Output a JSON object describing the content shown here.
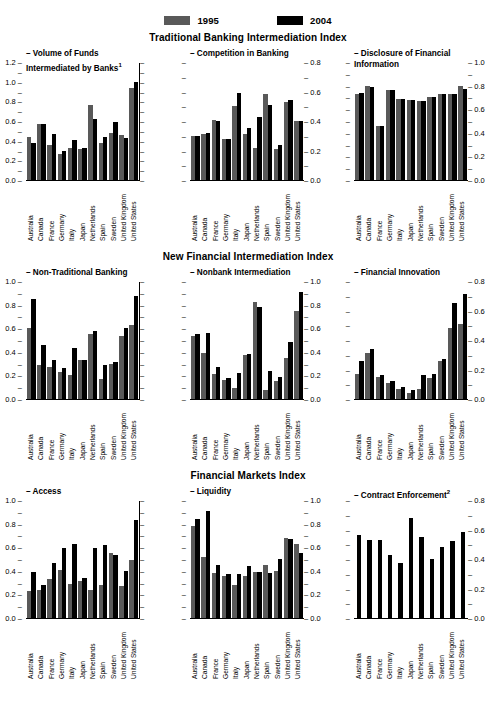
{
  "legend": {
    "items": [
      {
        "label": "1995",
        "color": "#595959",
        "key": "y1995"
      },
      {
        "label": "2004",
        "color": "#000000",
        "key": "y2004"
      }
    ]
  },
  "countries": [
    "Australia",
    "Canada",
    "France",
    "Germany",
    "Italy",
    "Japan",
    "Netherlands",
    "Spain",
    "Sweden",
    "United Kingdom",
    "United States"
  ],
  "sections": [
    {
      "title": "Traditional Banking Intermediation Index"
    },
    {
      "title": "New Financial Intermediation Index"
    },
    {
      "title": "Financial Markets Index"
    }
  ],
  "chart_data": [
    {
      "type": "bar",
      "title": "Volume of Funds\nIntermediated by Banks",
      "title_sup": "1",
      "section": "Traditional Banking Intermediation Index",
      "categories": [
        "Australia",
        "Canada",
        "France",
        "Germany",
        "Italy",
        "Japan",
        "Netherlands",
        "Spain",
        "Sweden",
        "United Kingdom",
        "United States"
      ],
      "series": [
        {
          "name": "1995",
          "values": [
            0.44,
            0.57,
            0.36,
            0.26,
            0.33,
            0.32,
            0.76,
            0.38,
            0.48,
            0.46,
            0.94
          ]
        },
        {
          "name": "2004",
          "values": [
            0.38,
            0.57,
            0.47,
            0.3,
            0.41,
            0.33,
            0.62,
            0.44,
            0.59,
            0.43,
            1.0
          ]
        }
      ],
      "axis_side": "left",
      "ylim": [
        0.0,
        1.2
      ],
      "yticks": [
        0.0,
        0.2,
        0.4,
        0.6,
        0.8,
        1.0,
        1.2
      ],
      "ylabel": "",
      "xlabel": "",
      "grid": false
    },
    {
      "type": "bar",
      "title": "Competition in Banking",
      "title_sup": "",
      "section": "Traditional Banking Intermediation Index",
      "categories": [
        "Australia",
        "Canada",
        "France",
        "Germany",
        "Italy",
        "Japan",
        "Netherlands",
        "Spain",
        "Sweden",
        "United Kingdom",
        "United States"
      ],
      "series": [
        {
          "name": "1995",
          "values": [
            0.3,
            0.31,
            0.41,
            0.28,
            0.5,
            0.31,
            0.22,
            0.58,
            0.21,
            0.53,
            0.4
          ]
        },
        {
          "name": "2004",
          "values": [
            0.3,
            0.32,
            0.4,
            0.28,
            0.59,
            0.35,
            0.43,
            0.51,
            0.24,
            0.54,
            0.4
          ]
        }
      ],
      "axis_side": "right",
      "ylim": [
        0.0,
        0.8
      ],
      "yticks": [
        0.0,
        0.2,
        0.4,
        0.6,
        0.8
      ],
      "ylabel": "",
      "xlabel": "",
      "grid": false
    },
    {
      "type": "bar",
      "title": "Disclosure of Financial\nInformation",
      "title_sup": "",
      "section": "Traditional Banking Intermediation Index",
      "categories": [
        "Australia",
        "Canada",
        "France",
        "Germany",
        "Italy",
        "Japan",
        "Netherlands",
        "Spain",
        "Sweden",
        "United Kingdom",
        "United States"
      ],
      "series": [
        {
          "name": "1995",
          "values": [
            0.73,
            0.8,
            0.46,
            0.76,
            0.69,
            0.68,
            0.67,
            0.7,
            0.73,
            0.73,
            0.8
          ]
        },
        {
          "name": "2004",
          "values": [
            0.74,
            0.79,
            0.46,
            0.76,
            0.69,
            0.68,
            0.67,
            0.7,
            0.73,
            0.73,
            0.77
          ]
        }
      ],
      "axis_side": "right",
      "ylim": [
        0.0,
        1.0
      ],
      "yticks": [
        0.0,
        0.2,
        0.4,
        0.6,
        0.8,
        1.0
      ],
      "ylabel": "",
      "xlabel": "",
      "grid": false
    },
    {
      "type": "bar",
      "title": "Non-Traditional Banking",
      "title_sup": "",
      "section": "New Financial Intermediation Index",
      "categories": [
        "Australia",
        "Canada",
        "France",
        "Germany",
        "Italy",
        "Japan",
        "Netherlands",
        "Spain",
        "Sweden",
        "United Kingdom",
        "United States"
      ],
      "series": [
        {
          "name": "1995",
          "values": [
            0.6,
            0.29,
            0.27,
            0.23,
            0.2,
            0.33,
            0.55,
            0.17,
            0.3,
            0.53,
            0.63
          ]
        },
        {
          "name": "2004",
          "values": [
            0.85,
            0.46,
            0.33,
            0.26,
            0.43,
            0.33,
            0.58,
            0.29,
            0.31,
            0.6,
            0.87
          ]
        }
      ],
      "axis_side": "left",
      "ylim": [
        0.0,
        1.0
      ],
      "yticks": [
        0.0,
        0.2,
        0.4,
        0.6,
        0.8,
        1.0
      ],
      "ylabel": "",
      "xlabel": "",
      "grid": false
    },
    {
      "type": "bar",
      "title": "Nonbank Intermediation",
      "title_sup": "",
      "section": "New Financial Intermediation Index",
      "categories": [
        "Australia",
        "Canada",
        "France",
        "Germany",
        "Italy",
        "Japan",
        "Netherlands",
        "Spain",
        "Sweden",
        "United Kingdom",
        "United States"
      ],
      "series": [
        {
          "name": "1995",
          "values": [
            0.53,
            0.39,
            0.21,
            0.16,
            0.09,
            0.37,
            0.82,
            0.08,
            0.15,
            0.35,
            0.75
          ]
        },
        {
          "name": "2004",
          "values": [
            0.55,
            0.56,
            0.27,
            0.18,
            0.22,
            0.38,
            0.78,
            0.24,
            0.19,
            0.48,
            0.91
          ]
        }
      ],
      "axis_side": "right",
      "ylim": [
        0.0,
        1.0
      ],
      "yticks": [
        0.0,
        0.2,
        0.4,
        0.6,
        0.8,
        1.0
      ],
      "ylabel": "",
      "xlabel": "",
      "grid": false
    },
    {
      "type": "bar",
      "title": "Financial Innovation",
      "title_sup": "",
      "section": "New Financial Intermediation Index",
      "categories": [
        "Australia",
        "Canada",
        "France",
        "Germany",
        "Italy",
        "Japan",
        "Netherlands",
        "Spain",
        "Sweden",
        "United Kingdom",
        "United States"
      ],
      "series": [
        {
          "name": "1995",
          "values": [
            0.17,
            0.31,
            0.15,
            0.11,
            0.07,
            0.04,
            0.07,
            0.14,
            0.26,
            0.48,
            0.51
          ]
        },
        {
          "name": "2004",
          "values": [
            0.26,
            0.34,
            0.16,
            0.12,
            0.08,
            0.06,
            0.16,
            0.17,
            0.27,
            0.65,
            0.71
          ]
        }
      ],
      "axis_side": "right",
      "ylim": [
        0.0,
        0.8
      ],
      "yticks": [
        0.0,
        0.2,
        0.4,
        0.6,
        0.8
      ],
      "ylabel": "",
      "xlabel": "",
      "grid": false
    },
    {
      "type": "bar",
      "title": "Access",
      "title_sup": "",
      "section": "Financial Markets Index",
      "categories": [
        "Australia",
        "Canada",
        "France",
        "Germany",
        "Italy",
        "Japan",
        "Netherlands",
        "Spain",
        "Sweden",
        "United Kingdom",
        "United States"
      ],
      "series": [
        {
          "name": "1995",
          "values": [
            0.23,
            0.24,
            0.33,
            0.41,
            0.29,
            0.31,
            0.24,
            0.28,
            0.55,
            0.27,
            0.49
          ]
        },
        {
          "name": "2004",
          "values": [
            0.39,
            0.28,
            0.47,
            0.59,
            0.63,
            0.34,
            0.59,
            0.62,
            0.53,
            0.4,
            0.83
          ]
        }
      ],
      "axis_side": "left",
      "ylim": [
        0.0,
        1.0
      ],
      "yticks": [
        0.0,
        0.2,
        0.4,
        0.6,
        0.8,
        1.0
      ],
      "ylabel": "",
      "xlabel": "",
      "grid": false
    },
    {
      "type": "bar",
      "title": "Liquidity",
      "title_sup": "",
      "section": "Financial Markets Index",
      "categories": [
        "Australia",
        "Canada",
        "France",
        "Germany",
        "Italy",
        "Japan",
        "Netherlands",
        "Spain",
        "Sweden",
        "United Kingdom",
        "United States"
      ],
      "series": [
        {
          "name": "1995",
          "values": [
            0.78,
            0.52,
            0.38,
            0.36,
            0.28,
            0.36,
            0.39,
            0.45,
            0.4,
            0.68,
            0.63
          ]
        },
        {
          "name": "2004",
          "values": [
            0.84,
            0.91,
            0.45,
            0.37,
            0.37,
            0.44,
            0.39,
            0.38,
            0.5,
            0.67,
            0.55
          ]
        }
      ],
      "axis_side": "right",
      "ylim": [
        0.0,
        1.0
      ],
      "yticks": [
        0.0,
        0.2,
        0.4,
        0.6,
        0.8,
        1.0
      ],
      "ylabel": "",
      "xlabel": "",
      "grid": false
    },
    {
      "type": "bar",
      "title": "Contract Enforcement",
      "title_sup": "2",
      "section": "Financial Markets Index",
      "categories": [
        "Australia",
        "Canada",
        "France",
        "Germany",
        "Italy",
        "Japan",
        "Netherlands",
        "Spain",
        "Sweden",
        "United Kingdom",
        "United States"
      ],
      "series": [
        {
          "name": "2004",
          "values": [
            0.56,
            0.53,
            0.53,
            0.43,
            0.37,
            0.68,
            0.55,
            0.4,
            0.48,
            0.52,
            0.58
          ]
        }
      ],
      "axis_side": "right",
      "ylim": [
        0.0,
        0.8
      ],
      "yticks": [
        0.0,
        0.2,
        0.4,
        0.6,
        0.8
      ],
      "ylabel": "",
      "xlabel": "",
      "grid": false
    }
  ]
}
